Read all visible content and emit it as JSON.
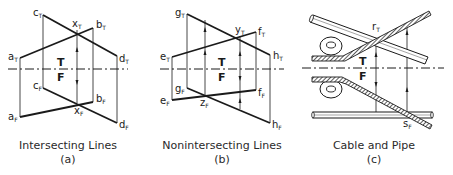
{
  "panels": [
    {
      "id": "a",
      "caption": "Intersecting Lines",
      "letter": "(a)",
      "planes": {
        "top": "T",
        "front": "F"
      },
      "labels": {
        "aT": {
          "m": "a",
          "s": "T"
        },
        "bT": {
          "m": "b",
          "s": "T"
        },
        "cT": {
          "m": "c",
          "s": "T"
        },
        "dT": {
          "m": "d",
          "s": "T"
        },
        "xT": {
          "m": "x",
          "s": "T"
        },
        "aF": {
          "m": "a",
          "s": "F"
        },
        "bF": {
          "m": "b",
          "s": "F"
        },
        "cF": {
          "m": "c",
          "s": "F"
        },
        "dF": {
          "m": "d",
          "s": "F"
        },
        "xF": {
          "m": "x",
          "s": "F"
        }
      }
    },
    {
      "id": "b",
      "caption": "Nonintersecting Lines",
      "letter": "(b)",
      "planes": {
        "top": "T",
        "front": "F"
      },
      "labels": {
        "gT": {
          "m": "g",
          "s": "T"
        },
        "hT": {
          "m": "h",
          "s": "T"
        },
        "eT": {
          "m": "e",
          "s": "T"
        },
        "fT": {
          "m": "f",
          "s": "T"
        },
        "yT": {
          "m": "y",
          "s": "T"
        },
        "gF": {
          "m": "g",
          "s": "F"
        },
        "hF": {
          "m": "h",
          "s": "F"
        },
        "eF": {
          "m": "e",
          "s": "F"
        },
        "fF": {
          "m": "f",
          "s": "F"
        },
        "zF": {
          "m": "z",
          "s": "F"
        }
      }
    },
    {
      "id": "c",
      "caption": "Cable and Pipe",
      "letter": "(c)",
      "planes": {
        "top": "T",
        "front": "F"
      },
      "labels": {
        "rT": {
          "m": "r",
          "s": "T"
        },
        "sF": {
          "m": "s",
          "s": "F"
        }
      }
    }
  ]
}
